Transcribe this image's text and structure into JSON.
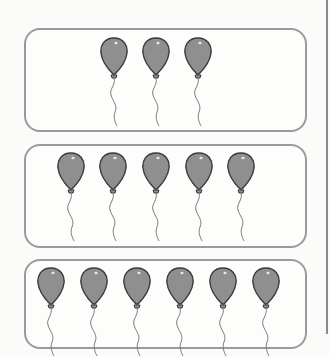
{
  "worksheet": {
    "boxes": [
      {
        "count": 3,
        "top": 28,
        "height": 104,
        "balloon_top": 7,
        "balloon_x": [
          98,
          140,
          182
        ]
      },
      {
        "count": 5,
        "top": 144,
        "height": 104,
        "balloon_top": 6,
        "balloon_x": [
          55,
          97,
          140,
          183,
          225
        ]
      },
      {
        "count": 6,
        "top": 259,
        "height": 90,
        "balloon_top": 6,
        "balloon_x": [
          35,
          78,
          121,
          164,
          207,
          250
        ]
      }
    ],
    "colors": {
      "balloon_fill": "#8f8f8f",
      "balloon_outline": "#3a3a3a",
      "border": "#9a9a9a",
      "string": "#7a7a7a"
    },
    "icon": "balloon-icon"
  }
}
